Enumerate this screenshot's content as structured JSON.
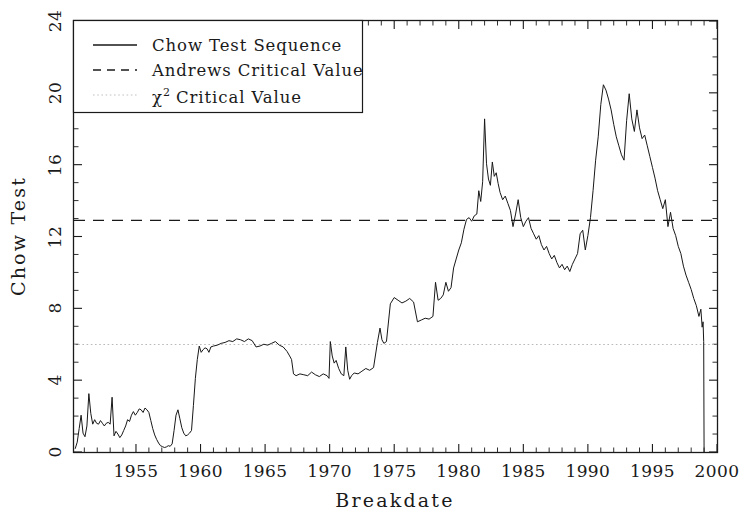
{
  "chart_data": {
    "type": "line",
    "title": "",
    "xlabel": "Breakdate",
    "ylabel": "Chow Test",
    "xlim": [
      1950.2,
      2000.0
    ],
    "ylim": [
      0,
      24
    ],
    "xticks": [
      1955,
      1960,
      1965,
      1970,
      1975,
      1980,
      1985,
      1990,
      1995,
      2000
    ],
    "yticks": [
      0,
      4,
      8,
      12,
      16,
      20,
      24
    ],
    "xtick_labels": [
      "1955",
      "1960",
      "1965",
      "1970",
      "1975",
      "1980",
      "1985",
      "1990",
      "1995",
      "2000"
    ],
    "ytick_labels": [
      "0",
      "4",
      "8",
      "12",
      "16",
      "20",
      "24"
    ],
    "x_minor_tick_interval": 1,
    "y_minor_tick_interval": 1,
    "grid": false,
    "legend_position": "upper left",
    "series": [
      {
        "name": "Chow Test Sequence",
        "style": "solid",
        "color": "#181818",
        "x": [
          1950.3,
          1950.45,
          1950.6,
          1950.75,
          1950.9,
          1951.05,
          1951.2,
          1951.35,
          1951.5,
          1951.65,
          1951.8,
          1951.95,
          1952.1,
          1952.25,
          1952.4,
          1952.55,
          1952.7,
          1952.85,
          1953.0,
          1953.15,
          1953.3,
          1953.45,
          1953.6,
          1953.75,
          1953.9,
          1954.05,
          1954.2,
          1954.35,
          1954.5,
          1954.65,
          1954.8,
          1954.95,
          1955.1,
          1955.25,
          1955.4,
          1955.55,
          1955.7,
          1955.85,
          1956.0,
          1956.15,
          1956.3,
          1956.45,
          1956.6,
          1956.75,
          1956.9,
          1957.05,
          1957.2,
          1957.35,
          1957.5,
          1957.65,
          1957.8,
          1957.95,
          1958.1,
          1958.25,
          1958.4,
          1958.55,
          1958.7,
          1958.85,
          1959.0,
          1959.15,
          1959.3,
          1959.45,
          1959.6,
          1959.75,
          1959.9,
          1960.05,
          1960.2,
          1960.35,
          1960.5,
          1960.65,
          1960.8,
          1961.0,
          1961.3,
          1961.6,
          1961.9,
          1962.2,
          1962.5,
          1962.8,
          1963.1,
          1963.4,
          1963.7,
          1964.0,
          1964.3,
          1964.6,
          1964.9,
          1965.2,
          1965.5,
          1965.8,
          1966.1,
          1966.4,
          1966.7,
          1966.9,
          1967.05,
          1967.2,
          1967.4,
          1967.7,
          1968.0,
          1968.3,
          1968.6,
          1968.9,
          1969.2,
          1969.5,
          1969.8,
          1969.95,
          1970.05,
          1970.2,
          1970.35,
          1970.5,
          1970.7,
          1970.9,
          1971.1,
          1971.25,
          1971.4,
          1971.55,
          1971.7,
          1971.9,
          1972.2,
          1972.5,
          1972.8,
          1973.1,
          1973.4,
          1973.7,
          1973.9,
          1974.05,
          1974.2,
          1974.4,
          1974.7,
          1975.0,
          1975.3,
          1975.6,
          1975.9,
          1976.2,
          1976.5,
          1976.8,
          1977.1,
          1977.4,
          1977.7,
          1978.0,
          1978.2,
          1978.4,
          1978.6,
          1978.8,
          1979.0,
          1979.2,
          1979.4,
          1979.6,
          1979.8,
          1980.0,
          1980.2,
          1980.4,
          1980.6,
          1980.8,
          1981.0,
          1981.2,
          1981.4,
          1981.55,
          1981.7,
          1981.85,
          1982.0,
          1982.15,
          1982.3,
          1982.45,
          1982.6,
          1982.75,
          1982.9,
          1983.05,
          1983.2,
          1983.4,
          1983.6,
          1983.8,
          1984.0,
          1984.2,
          1984.4,
          1984.6,
          1984.8,
          1985.0,
          1985.2,
          1985.4,
          1985.6,
          1985.8,
          1986.0,
          1986.2,
          1986.4,
          1986.6,
          1986.8,
          1987.0,
          1987.2,
          1987.4,
          1987.6,
          1987.8,
          1988.0,
          1988.2,
          1988.4,
          1988.6,
          1988.8,
          1989.0,
          1989.2,
          1989.4,
          1989.6,
          1989.8,
          1990.0,
          1990.2,
          1990.4,
          1990.6,
          1990.8,
          1991.0,
          1991.2,
          1991.4,
          1991.6,
          1991.8,
          1992.0,
          1992.2,
          1992.4,
          1992.6,
          1992.8,
          1993.0,
          1993.2,
          1993.4,
          1993.6,
          1993.8,
          1994.0,
          1994.2,
          1994.4,
          1994.6,
          1994.8,
          1995.0,
          1995.2,
          1995.4,
          1995.6,
          1995.8,
          1996.0,
          1996.2,
          1996.4,
          1996.6,
          1996.8,
          1997.0,
          1997.2,
          1997.4,
          1997.6,
          1997.8,
          1998.0,
          1998.2,
          1998.4,
          1998.6,
          1998.75,
          1998.85,
          1998.92,
          1998.97,
          1999.0
        ],
        "y": [
          0.2,
          0.55,
          1.3,
          2.05,
          1.05,
          0.85,
          1.45,
          3.25,
          2.15,
          1.55,
          1.8,
          1.6,
          1.55,
          1.75,
          1.6,
          1.45,
          1.6,
          1.65,
          1.55,
          3.05,
          0.9,
          1.15,
          1.0,
          0.8,
          0.95,
          1.2,
          1.45,
          1.8,
          1.7,
          2.05,
          2.25,
          2.05,
          2.2,
          2.4,
          2.35,
          2.2,
          2.45,
          2.35,
          2.2,
          1.75,
          1.3,
          0.95,
          0.7,
          0.5,
          0.35,
          0.3,
          0.25,
          0.28,
          0.35,
          0.32,
          0.45,
          1.2,
          2.05,
          2.35,
          1.85,
          1.35,
          1.05,
          0.9,
          0.95,
          1.05,
          1.2,
          2.6,
          4.1,
          5.15,
          5.9,
          5.55,
          5.7,
          5.8,
          5.75,
          5.55,
          5.85,
          5.9,
          5.95,
          6.05,
          6.1,
          6.2,
          6.15,
          6.3,
          6.25,
          6.15,
          6.3,
          6.2,
          5.85,
          5.9,
          6.0,
          5.95,
          6.05,
          6.15,
          5.95,
          5.85,
          5.6,
          5.35,
          5.15,
          4.35,
          4.25,
          4.35,
          4.3,
          4.25,
          4.45,
          4.3,
          4.2,
          4.35,
          4.25,
          4.1,
          6.15,
          5.35,
          4.95,
          5.1,
          4.65,
          4.35,
          4.25,
          5.85,
          4.55,
          4.05,
          4.25,
          4.4,
          4.35,
          4.5,
          4.65,
          4.55,
          4.7,
          6.1,
          6.9,
          6.25,
          6.05,
          6.15,
          8.25,
          8.6,
          8.45,
          8.3,
          8.4,
          8.55,
          8.35,
          7.25,
          7.35,
          7.45,
          7.4,
          7.55,
          9.45,
          8.45,
          8.55,
          8.75,
          9.45,
          8.95,
          9.15,
          10.25,
          10.75,
          11.25,
          11.65,
          12.4,
          12.95,
          13.05,
          12.85,
          13.15,
          13.25,
          14.55,
          13.95,
          15.05,
          18.55,
          16.05,
          15.2,
          14.85,
          16.15,
          15.35,
          15.55,
          14.95,
          14.45,
          14.05,
          14.25,
          13.85,
          13.45,
          12.55,
          13.25,
          14.05,
          13.05,
          12.55,
          12.85,
          13.05,
          12.45,
          12.15,
          11.85,
          12.05,
          11.55,
          11.25,
          11.45,
          11.05,
          10.75,
          10.95,
          10.55,
          10.25,
          10.45,
          10.15,
          10.35,
          10.05,
          10.45,
          10.75,
          11.05,
          12.15,
          12.35,
          11.25,
          12.05,
          13.05,
          14.55,
          16.25,
          17.55,
          19.35,
          20.45,
          20.15,
          19.65,
          19.05,
          18.25,
          17.55,
          17.05,
          16.55,
          16.25,
          18.45,
          19.95,
          18.55,
          17.85,
          19.05,
          18.05,
          17.45,
          17.65,
          17.05,
          16.45,
          15.85,
          15.25,
          14.55,
          14.05,
          13.55,
          14.05,
          12.55,
          13.35,
          12.45,
          12.05,
          11.45,
          11.05,
          10.35,
          9.85,
          9.45,
          9.05,
          8.55,
          8.15,
          7.55,
          7.95,
          6.95,
          7.25,
          6.15,
          0.0
        ]
      }
    ],
    "reference_lines": [
      {
        "name": "Andrews Critical Value",
        "value": 12.9,
        "style": "dashed",
        "color": "#1a1a1a"
      },
      {
        "name": "chi-squared Critical Value",
        "value": 5.99,
        "style": "dotted",
        "color": "#b9b9b9"
      }
    ],
    "legend": [
      {
        "label": "Chow Test Sequence",
        "style": "solid"
      },
      {
        "label": "Andrews Critical Value",
        "style": "dashed"
      },
      {
        "label": "chi2 Critical Value",
        "style": "dotted",
        "prefix": "χ",
        "superscript": "2",
        "rest": " Critical Value"
      }
    ]
  },
  "axes": {
    "ylabel": "Chow Test",
    "xlabel": "Breakdate"
  }
}
